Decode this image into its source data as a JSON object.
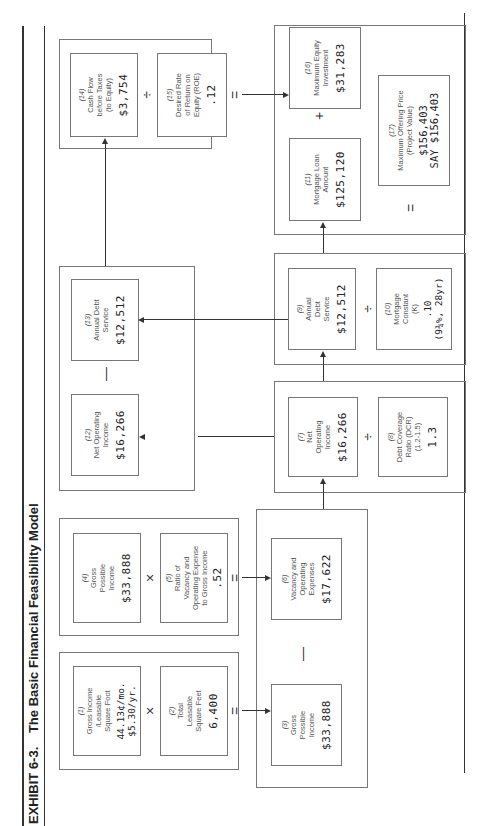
{
  "exhibit": {
    "number": "EXHIBIT 6-3.",
    "title": "The Basic Financial Feasibility Model"
  },
  "boxes": {
    "b1": {
      "num": "(1)",
      "label": [
        "Gross Income",
        "/Leasable",
        "Square Foot"
      ],
      "value": "44.13¢/mo.",
      "value2": "$5.30/yr."
    },
    "b2": {
      "num": "(2)",
      "label": [
        "Total",
        "Leasable",
        "Square Feet"
      ],
      "value": "6,400"
    },
    "b3": {
      "num": "(3)",
      "label": [
        "Gross",
        "Possible",
        "Income"
      ],
      "value": "$33,888"
    },
    "b4": {
      "num": "(4)",
      "label": [
        "Gross",
        "Possible",
        "Income"
      ],
      "value": "$33,888"
    },
    "b5": {
      "num": "(5)",
      "label": [
        "Ratio of",
        "Vacancy and",
        "Operating Expense",
        "to Gross Income"
      ],
      "value": ".52"
    },
    "b6": {
      "num": "(6)",
      "label": [
        "Vacancy and",
        "Operating",
        "Expenses"
      ],
      "value": "$17,622"
    },
    "b7": {
      "num": "(7)",
      "label": [
        "Net",
        "Operating",
        "Income"
      ],
      "value": "$16,266"
    },
    "b8": {
      "num": "(8)",
      "label": [
        "Debt Coverage",
        "Ratio (DCR)",
        "(1.2-1.5)"
      ],
      "value": "1.3"
    },
    "b9": {
      "num": "(9)",
      "label": [
        "Annual",
        "Debt",
        "Service"
      ],
      "value": "$12,512"
    },
    "b10": {
      "num": "(10)",
      "label": [
        "Mortgage",
        "Constant",
        "(K)"
      ],
      "value": ".10",
      "value2": "(9¾%, 28yr)"
    },
    "b11": {
      "num": "(11)",
      "label": [
        "Mortgage Loan",
        "Amount"
      ],
      "value": "$125,120"
    },
    "b12": {
      "num": "(12)",
      "label": [
        "Net Operating",
        "Income"
      ],
      "value": "$16,266"
    },
    "b13": {
      "num": "(13)",
      "label": [
        "Annual Debt",
        "Service"
      ],
      "value": "$12,512"
    },
    "b14": {
      "num": "(14)",
      "label": [
        "Cash Flow",
        "before Taxes",
        "(to Equity)"
      ],
      "value": "$3,754"
    },
    "b15": {
      "num": "(15)",
      "label": [
        "Desired Rate",
        "of Return on",
        "Equity (ROE)"
      ],
      "value": ".12"
    },
    "b16": {
      "num": "(16)",
      "label": [
        "Maximum Equity",
        "Investment"
      ],
      "value": "$31,283"
    },
    "b17": {
      "num": "(17)",
      "label": [
        "Maximum Offering Price",
        "(Project Value)"
      ],
      "value": "$156,403",
      "value2": "SAY $156,403"
    }
  },
  "operators": {
    "times": "×",
    "equals": "=",
    "minus": "—",
    "divide": "÷",
    "plus": "+"
  }
}
